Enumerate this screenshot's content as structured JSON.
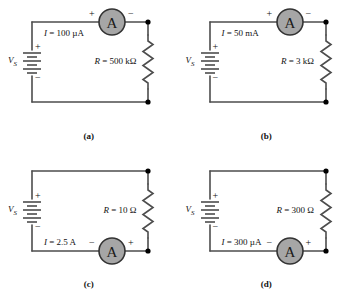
{
  "figure": {
    "panel_count": 4,
    "colors": {
      "wire": "#4d4d4d",
      "node": "#000000",
      "meter_fill": "#a6a6a6",
      "meter_stroke": "#333333",
      "text": "#111111",
      "background": "#ffffff"
    }
  },
  "panels": [
    {
      "caption": "(a)",
      "meter_position": "top",
      "meter_letter": "A",
      "meter_left_sign": "+",
      "meter_right_sign": "−",
      "source_label": "V",
      "source_subscript": "S",
      "source_plus": "+",
      "source_minus": "−",
      "current_label": "I = 100 µA",
      "resistor_label": "R = 500 kΩ"
    },
    {
      "caption": "(b)",
      "meter_position": "top",
      "meter_letter": "A",
      "meter_left_sign": "+",
      "meter_right_sign": "−",
      "source_label": "V",
      "source_subscript": "S",
      "source_plus": "+",
      "source_minus": "−",
      "current_label": "I = 50 mA",
      "resistor_label": "R = 3 kΩ"
    },
    {
      "caption": "(c)",
      "meter_position": "bottom",
      "meter_letter": "A",
      "meter_left_sign": "−",
      "meter_right_sign": "+",
      "source_label": "V",
      "source_subscript": "S",
      "source_plus": "+",
      "source_minus": "−",
      "current_label": "I = 2.5 A",
      "resistor_label": "R = 10 Ω"
    },
    {
      "caption": "(d)",
      "meter_position": "bottom",
      "meter_letter": "A",
      "meter_left_sign": "−",
      "meter_right_sign": "+",
      "source_label": "V",
      "source_subscript": "S",
      "source_plus": "+",
      "source_minus": "−",
      "current_label": "I = 300 µA",
      "resistor_label": "R = 300 Ω"
    }
  ]
}
